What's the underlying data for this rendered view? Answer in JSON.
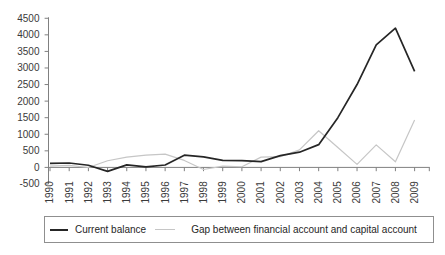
{
  "chart_data": {
    "type": "line",
    "title": "",
    "xlabel": "",
    "ylabel": "",
    "x": [
      "1990",
      "1991",
      "1992",
      "1993",
      "1994",
      "1995",
      "1996",
      "1997",
      "1998",
      "1999",
      "2000",
      "2001",
      "2002",
      "2003",
      "2004",
      "2005",
      "2006",
      "2007",
      "2008",
      "2009"
    ],
    "series": [
      {
        "name": "Current balance",
        "color": "#262626",
        "values": [
          120,
          133,
          64,
          -119,
          77,
          16,
          72,
          370,
          315,
          211,
          205,
          174,
          354,
          459,
          687,
          1500,
          2500,
          3700,
          4200,
          2900
        ]
      },
      {
        "name": "Gap between financial account and capital account",
        "color": "#c6c6c6",
        "values": [
          40,
          60,
          -3,
          200,
          310,
          370,
          400,
          210,
          -63,
          40,
          19,
          310,
          323,
          527,
          1107,
          600,
          90,
          680,
          170,
          1430
        ]
      }
    ],
    "ylim": [
      -500,
      4500
    ],
    "yticks": [
      4500,
      4000,
      3500,
      3000,
      2500,
      2000,
      1500,
      1000,
      500,
      0,
      -500
    ],
    "ytick_step": 500,
    "grid": false,
    "legend_position": "bottom",
    "axis_color": "#808080",
    "label_color": "#3a3a3a"
  }
}
